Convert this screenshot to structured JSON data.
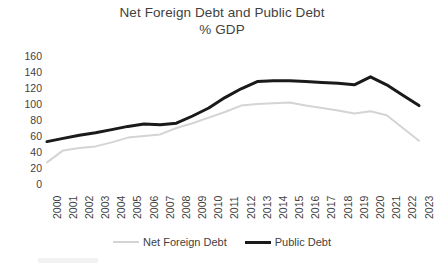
{
  "chart_data": {
    "type": "line",
    "title": "Net Foreign Debt and Public Debt",
    "subtitle": "% GDP",
    "xlabel": "",
    "ylabel": "",
    "ylim": [
      0,
      160
    ],
    "ytick_step": 20,
    "grid": false,
    "legend_position": "bottom",
    "categories": [
      "2000",
      "2001",
      "2002",
      "2003",
      "2004",
      "2005",
      "2006",
      "2007",
      "2008",
      "2009",
      "2010",
      "2011",
      "2012",
      "2013",
      "2014",
      "2015",
      "2016",
      "2017",
      "2018",
      "2019",
      "2020",
      "2021",
      "2022",
      "2023"
    ],
    "ytick_labels": [
      "160",
      "140",
      "120",
      "100",
      "80",
      "60",
      "40",
      "20",
      "0"
    ],
    "series": [
      {
        "name": "Net Foreign Debt",
        "color": "#d4d4d4",
        "width": 2,
        "values": [
          27,
          42,
          45,
          47,
          52,
          58,
          60,
          62,
          70,
          76,
          83,
          90,
          98,
          100,
          101,
          102,
          98,
          95,
          92,
          88,
          91,
          86,
          70,
          54
        ]
      },
      {
        "name": "Public Debt",
        "color": "#1a1a1a",
        "width": 3,
        "values": [
          53,
          57,
          61,
          64,
          68,
          72,
          75,
          74,
          76,
          85,
          95,
          108,
          119,
          128,
          129,
          129,
          128,
          127,
          126,
          124,
          134,
          124,
          111,
          98
        ]
      }
    ]
  },
  "legend": {
    "items": [
      {
        "label": "Net Foreign Debt",
        "color": "#d4d4d4",
        "style": "thin"
      },
      {
        "label": "Public Debt",
        "color": "#1a1a1a",
        "style": "thick"
      }
    ]
  }
}
